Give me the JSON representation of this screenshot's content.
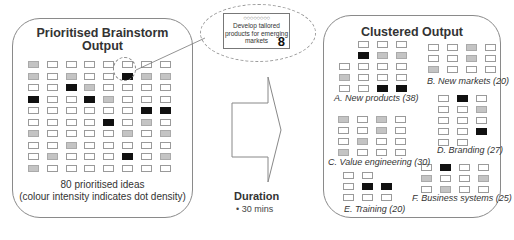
{
  "left_panel": {
    "title_line1": "Prioritised Brainstorm",
    "title_line2": "Output",
    "caption_line1": "80 prioritised ideas",
    "caption_line2": "(colour intensity indicates dot density)",
    "grid_rows": [
      "g......w",
      "g.g..kgg",
      "..kg....",
      "k..kg...",
      "......kk",
      "....k.g.",
      "g....g.g",
      "..g.....",
      ".g...k.g",
      "g......."
    ],
    "highlighted_cell": {
      "row": 1,
      "col": 5
    }
  },
  "callout": {
    "dots": "○○○○○○○○",
    "text_line1": "Develop tailored",
    "text_line2": "products for emerging",
    "text_line3": "markets",
    "score": "8"
  },
  "duration": {
    "heading": "Duration",
    "bullet": "30 mins"
  },
  "right_panel": {
    "title": "Clustered Output",
    "clusters": [
      {
        "id": "A",
        "label": "A. New products (38)"
      },
      {
        "id": "B",
        "label": "B. New markets (20)"
      },
      {
        "id": "C",
        "label": "C. Value engineering (30)"
      },
      {
        "id": "D",
        "label": "D. Branding (27)"
      },
      {
        "id": "E",
        "label": "E. Training (20)"
      },
      {
        "id": "F",
        "label": "F. Business systems (25)"
      }
    ]
  },
  "colors": {
    "high_density": "#111111",
    "medium_density": "#c4c4c4",
    "low_density": "#ffffff",
    "border": "#8a8a8a"
  }
}
